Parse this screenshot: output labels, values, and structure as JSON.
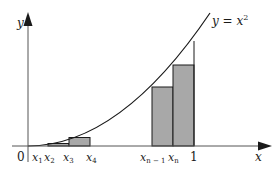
{
  "figure": {
    "curve_label": "y = x²",
    "curve_equation": "y = x^2",
    "axes": {
      "x_label": "x",
      "y_label": "y",
      "origin_label": "0",
      "x_end_label": "1"
    },
    "tick_labels": [
      {
        "id": "x1",
        "base": "x",
        "sub": "1"
      },
      {
        "id": "x2",
        "base": "x",
        "sub": "2"
      },
      {
        "id": "x3",
        "base": "x",
        "sub": "3"
      },
      {
        "id": "x4",
        "base": "x",
        "sub": "4"
      },
      {
        "id": "xn-1",
        "base": "x",
        "sub": "n − 1"
      },
      {
        "id": "xn",
        "base": "x",
        "sub": "n"
      }
    ],
    "rectangles": [
      {
        "interval": "[x1, x2]",
        "height_rel": "x1^2"
      },
      {
        "interval": "[x2, x3]",
        "height_rel": "x2^2"
      },
      {
        "interval": "[x3, x4]",
        "height_rel": "x3^2"
      },
      {
        "interval": "[x(n-1), xn]",
        "height_rel": "x(n-1)^2"
      },
      {
        "interval": "[xn, 1]",
        "height_rel": "xn^2"
      }
    ],
    "colors": {
      "rect_fill": "#a8a8a8",
      "stroke": "#1a1a1a",
      "axis": "#555555"
    }
  }
}
